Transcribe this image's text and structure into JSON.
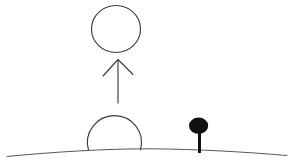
{
  "canvas": {
    "width": 291,
    "height": 165,
    "background": "#ffffff"
  },
  "colors": {
    "stroke": "#3d3d3d",
    "ground": "#575757",
    "tree": "#101010"
  },
  "shapes": {
    "floating_circle": {
      "cx": 116,
      "cy": 29,
      "rx": 24.5,
      "ry": 23.5
    },
    "up_arrow": {
      "shaft_path": "M118 60 L118 103",
      "head_points": "103,76 118,59.5 133,74.5"
    },
    "dome": {
      "path": "M88.5 150 A27 27 0 1 1 140.5 149.8"
    },
    "ground_line": {
      "path": "M7 156.5 C55 151.8 105 148.8 150 148.8 C200 149.2 245 152 287 155.5"
    },
    "tree": {
      "crown": {
        "cx": 198.6,
        "cy": 125.7,
        "rx": 9.6,
        "ry": 8.2
      },
      "trunk": {
        "x": 198,
        "y": 131,
        "width": 3,
        "height": 22
      }
    }
  }
}
